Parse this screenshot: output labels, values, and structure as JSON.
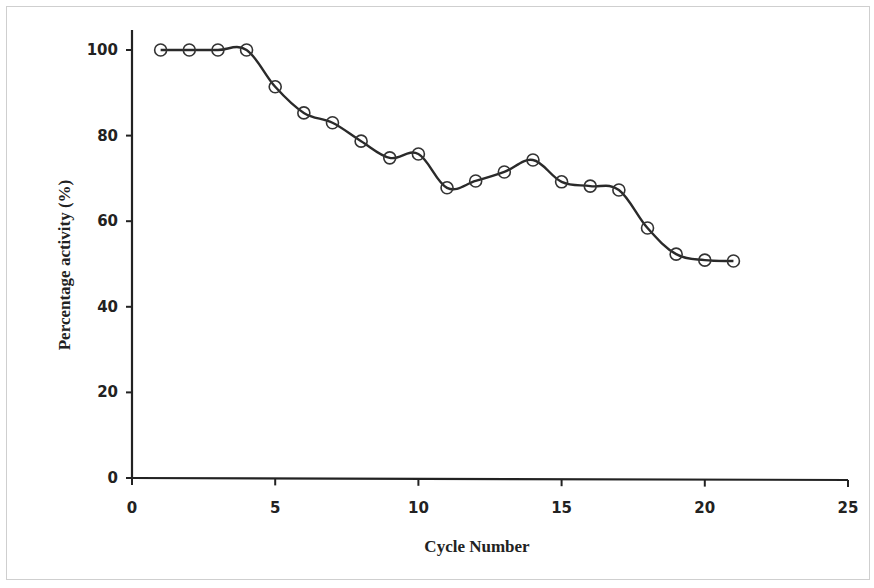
{
  "chart_data": {
    "type": "line",
    "title": "",
    "xlabel": "Cycle Number",
    "ylabel": "Percentage  activity (%)",
    "xlim": [
      0,
      25
    ],
    "ylim": [
      0,
      100
    ],
    "xticks": [
      0,
      5,
      10,
      15,
      20,
      25
    ],
    "yticks": [
      0,
      20,
      40,
      60,
      80,
      100
    ],
    "grid": false,
    "legend": null,
    "marker": "open-circle",
    "line_color": "#2a2a2a",
    "series": [
      {
        "name": "Percentage activity",
        "x": [
          1,
          2,
          3,
          4,
          5,
          6,
          7,
          8,
          9,
          10,
          11,
          12,
          13,
          14,
          15,
          16,
          17,
          18,
          19,
          20,
          21
        ],
        "y": [
          100,
          100,
          100,
          100,
          91.4,
          85.3,
          83,
          78.7,
          74.8,
          75.7,
          67.8,
          69.4,
          71.5,
          74.3,
          69.2,
          68.2,
          67.3,
          58.4,
          52.3,
          50.9,
          50.7
        ]
      }
    ]
  }
}
